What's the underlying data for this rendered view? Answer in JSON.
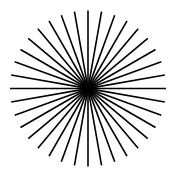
{
  "diagram": {
    "type": "siemens-star",
    "ray_count": 36,
    "angle_step_deg": 10,
    "center": [
      88,
      88.5
    ],
    "outer_radius": 78,
    "inner_radius": 2,
    "ray_color": "#000000",
    "ray_width": 1.6,
    "center_dot_radius": 3.5,
    "center_dot_color": "#000000",
    "background": "#ffffff"
  }
}
